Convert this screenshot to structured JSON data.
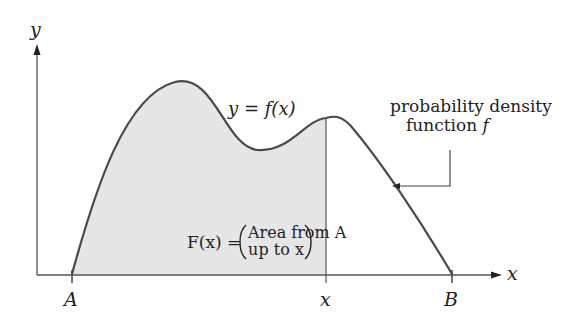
{
  "diagram": {
    "axes": {
      "y_label": "y",
      "x_label": "x"
    },
    "curve_label": "y = f(x)",
    "callout": {
      "line1": "probability density",
      "line2": "function ",
      "line2_var": "f"
    },
    "area_formula": {
      "lhs": "F(x) =",
      "line1": "Area from A",
      "line2": "up to x"
    },
    "ticks": {
      "a": "A",
      "x": "x",
      "b": "B"
    },
    "colors": {
      "fill": "#e6e6e6",
      "stroke": "#4a4a4a",
      "axis": "#555555"
    }
  }
}
